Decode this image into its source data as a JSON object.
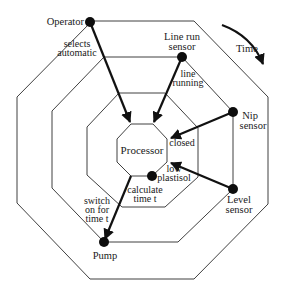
{
  "diagram": {
    "type": "concentric-octagon timing/data-flow diagram",
    "time_label": "Time",
    "center": {
      "label": "Processor"
    },
    "nodes": [
      {
        "id": "operator",
        "lines": [
          "Operator"
        ]
      },
      {
        "id": "line_run_sensor",
        "lines": [
          "Line run",
          "sensor"
        ]
      },
      {
        "id": "nip_sensor",
        "lines": [
          "Nip",
          "sensor"
        ]
      },
      {
        "id": "level_sensor",
        "lines": [
          "Level",
          "sensor"
        ]
      },
      {
        "id": "pump",
        "lines": [
          "Pump"
        ]
      },
      {
        "id": "calculate_point",
        "lines": []
      }
    ],
    "edges": [
      {
        "from": "operator",
        "to": "processor",
        "lines": [
          "selects",
          "automatic"
        ]
      },
      {
        "from": "line_run_sensor",
        "to": "processor",
        "lines": [
          "line",
          "running"
        ]
      },
      {
        "from": "nip_sensor",
        "to": "processor",
        "lines": [
          "closed"
        ]
      },
      {
        "from": "level_sensor",
        "to": "processor",
        "lines": [
          "low",
          "plastisol"
        ]
      },
      {
        "from": "processor",
        "to": "calculate_point",
        "lines": [
          "calculate",
          "time t"
        ]
      },
      {
        "from": "processor",
        "to": "pump",
        "lines": [
          "switch",
          "on for",
          "time t"
        ]
      }
    ],
    "colors": {
      "line": "#2a2a2a",
      "arrow": "#111111",
      "node": "#0d0d0d",
      "background": "#ffffff"
    }
  }
}
